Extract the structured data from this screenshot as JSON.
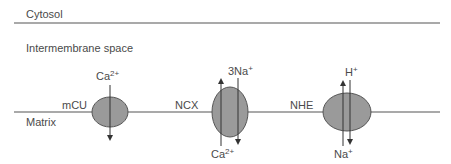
{
  "compartments": {
    "cytosol": "Cytosol",
    "intermembrane": "Intermembrane space",
    "matrix": "Matrix"
  },
  "transporters": [
    {
      "name": "mCU",
      "top_ion": "Ca",
      "top_charge": "2+",
      "bottom_ion": "",
      "bottom_charge": ""
    },
    {
      "name": "NCX",
      "top_ion": "3Na",
      "top_charge": "+",
      "bottom_ion": "Ca",
      "bottom_charge": "2+"
    },
    {
      "name": "NHE",
      "top_ion": "H",
      "top_charge": "+",
      "bottom_ion": "Na",
      "bottom_charge": "+"
    }
  ],
  "colors": {
    "line": "#555555",
    "transporter_fill": "#9a9a9a",
    "transporter_stroke": "#555555",
    "text": "#4a4a4a"
  }
}
